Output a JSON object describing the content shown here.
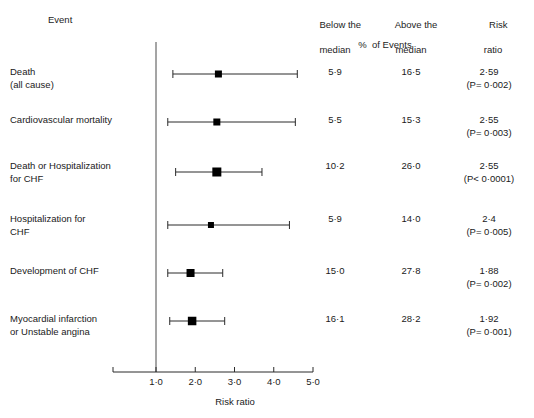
{
  "figure": {
    "type": "forest-plot",
    "background": "#ffffff",
    "ink_color": "#1d1d1d"
  },
  "header": {
    "event_label": "Event",
    "below_median_l1": "Below the",
    "below_median_l2": "median",
    "above_median_l1": "Above the",
    "above_median_l2": "median",
    "risk_ratio_l1": "Risk",
    "risk_ratio_l2": "ratio",
    "percent_of_events": "%  of Events"
  },
  "axis": {
    "title": "Risk ratio",
    "tick_labels": [
      "1·0",
      "2·0",
      "3·0",
      "4·0",
      "5·0"
    ],
    "tick_values": [
      1.0,
      2.0,
      3.0,
      4.0,
      5.0
    ],
    "xlim": [
      0.55,
      5.0
    ],
    "reference_line_value": 1.0
  },
  "rows": [
    {
      "event": "Death\n(all cause)",
      "below_median": "5·9",
      "above_median": "16·5",
      "risk_ratio": "2·59",
      "p_value_prefix": "=",
      "p_value": "0·002",
      "p_text": "(P= 0·002)"
    },
    {
      "event": "Cardiovascular mortality",
      "below_median": "5·5",
      "above_median": "15·3",
      "risk_ratio": "2·55",
      "p_value_prefix": "=",
      "p_value": "0·003",
      "p_text": "(P= 0·003)"
    },
    {
      "event": "Death or Hospitalization\nfor CHF",
      "below_median": "10·2",
      "above_median": "26·0",
      "risk_ratio": "2·55",
      "p_value_prefix": "<",
      "p_value": "0·0001",
      "p_text": "(P< 0·0001)"
    },
    {
      "event": "Hospitalization for\nCHF",
      "below_median": "5·9",
      "above_median": "14·0",
      "risk_ratio": "2·4",
      "p_value_prefix": "=",
      "p_value": "0·005",
      "p_text": "(P= 0·005)"
    },
    {
      "event": "Development of CHF",
      "below_median": "15·0",
      "above_median": "27·8",
      "risk_ratio": "1·88",
      "p_value_prefix": "=",
      "p_value": "0·002",
      "p_text": "(P= 0·002)"
    },
    {
      "event": "Myocardial infarction\nor Unstable angina",
      "below_median": "16·1",
      "above_median": "28·2",
      "risk_ratio": "1·92",
      "p_value_prefix": "=",
      "p_value": "0·001",
      "p_text": "(P= 0·001)"
    }
  ],
  "chart_data": {
    "type": "scatter",
    "title": "",
    "xlabel": "Risk ratio",
    "ylabel": "",
    "xlim": [
      0.55,
      5.05
    ],
    "xticks": [
      1.0,
      2.0,
      3.0,
      4.0,
      5.0
    ],
    "xticklabels": [
      "1·0",
      "2·0",
      "3·0",
      "4·0",
      "5·0"
    ],
    "grid": false,
    "legend": "none",
    "reference_line": 1.0,
    "categories": [
      "Death (all cause)",
      "Cardiovascular mortality",
      "Death or Hospitalization for CHF",
      "Hospitalization for CHF",
      "Development of CHF",
      "Myocardial infarction or Unstable angina"
    ],
    "series": [
      {
        "name": "Risk ratio (point estimate)",
        "values": [
          2.59,
          2.55,
          2.55,
          2.4,
          1.88,
          1.92
        ]
      },
      {
        "name": "95% CI lower",
        "values": [
          1.43,
          1.3,
          1.5,
          1.3,
          1.3,
          1.35
        ]
      },
      {
        "name": "95% CI upper",
        "values": [
          4.6,
          4.55,
          3.7,
          4.4,
          2.7,
          2.75
        ]
      }
    ],
    "marker_sizes": [
      7,
      7,
      9,
      6,
      8,
      8.5
    ],
    "percent_below_median": [
      5.9,
      5.5,
      10.2,
      5.9,
      15.0,
      16.1
    ],
    "percent_above_median": [
      16.5,
      15.3,
      26.0,
      14.0,
      27.8,
      28.2
    ],
    "p_values": [
      0.002,
      0.003,
      0.0001,
      0.005,
      0.002,
      0.001
    ],
    "p_value_operators": [
      "=",
      "=",
      "<",
      "=",
      "=",
      "="
    ]
  }
}
